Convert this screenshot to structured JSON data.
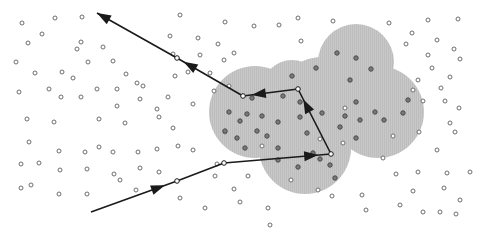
{
  "diagram": {
    "width": 482,
    "height": 228,
    "colors": {
      "background": "#ffffff",
      "cloud_fill": "#c8c8c8",
      "particle_outside": "#6e6e6e",
      "particle_inside_fill": "#7a7a7a",
      "particle_inside_stroke": "#4a4a4a",
      "path": "#1a1a1a"
    },
    "cloud": {
      "lobes": [
        {
          "cx": 356,
          "cy": 62,
          "r": 38
        },
        {
          "cx": 255,
          "cy": 112,
          "r": 46
        },
        {
          "cx": 305,
          "cy": 148,
          "r": 46
        },
        {
          "cx": 378,
          "cy": 112,
          "r": 46
        },
        {
          "cx": 322,
          "cy": 105,
          "r": 48
        },
        {
          "cx": 292,
          "cy": 90,
          "r": 30
        }
      ]
    },
    "path": {
      "vertices": [
        [
          91,
          212
        ],
        [
          177,
          181
        ],
        [
          224,
          163
        ],
        [
          331,
          154
        ],
        [
          298,
          89
        ],
        [
          243,
          96
        ],
        [
          177,
          58
        ],
        [
          97,
          13
        ]
      ],
      "arrowheads": [
        {
          "from": [
            91,
            212
          ],
          "to": [
            177,
            181
          ],
          "at": 0.86
        },
        {
          "from": [
            224,
            163
          ],
          "to": [
            331,
            154
          ],
          "at": 0.88
        },
        {
          "from": [
            331,
            154
          ],
          "to": [
            298,
            89
          ],
          "at": 0.84
        },
        {
          "from": [
            298,
            89
          ],
          "to": [
            243,
            96
          ],
          "at": 0.84
        },
        {
          "from": [
            243,
            96
          ],
          "to": [
            177,
            58
          ],
          "at": 0.9
        },
        {
          "from": [
            177,
            58
          ],
          "to": [
            97,
            13
          ],
          "at": 1.0
        }
      ]
    },
    "particles_outside": [
      [
        22,
        23
      ],
      [
        55,
        18
      ],
      [
        82,
        17
      ],
      [
        42,
        34
      ],
      [
        81,
        42
      ],
      [
        28,
        43
      ],
      [
        77,
        49
      ],
      [
        103,
        47
      ],
      [
        16,
        62
      ],
      [
        35,
        73
      ],
      [
        62,
        72
      ],
      [
        88,
        62
      ],
      [
        73,
        78
      ],
      [
        113,
        61
      ],
      [
        126,
        74
      ],
      [
        143,
        86
      ],
      [
        19,
        92
      ],
      [
        49,
        89
      ],
      [
        61,
        97
      ],
      [
        81,
        97
      ],
      [
        97,
        89
      ],
      [
        117,
        89
      ],
      [
        137,
        83
      ],
      [
        117,
        106
      ],
      [
        140,
        99
      ],
      [
        157,
        109
      ],
      [
        180,
        15
      ],
      [
        225,
        22
      ],
      [
        254,
        26
      ],
      [
        279,
        25
      ],
      [
        298,
        18
      ],
      [
        301,
        41
      ],
      [
        170,
        36
      ],
      [
        198,
        38
      ],
      [
        218,
        44
      ],
      [
        234,
        53
      ],
      [
        200,
        55
      ],
      [
        173,
        54
      ],
      [
        188,
        72
      ],
      [
        210,
        73
      ],
      [
        224,
        60
      ],
      [
        229,
        86
      ],
      [
        175,
        76
      ],
      [
        214,
        91
      ],
      [
        168,
        97
      ],
      [
        193,
        104
      ],
      [
        27,
        119
      ],
      [
        54,
        122
      ],
      [
        99,
        119
      ],
      [
        125,
        123
      ],
      [
        159,
        117
      ],
      [
        29,
        142
      ],
      [
        59,
        151
      ],
      [
        85,
        152
      ],
      [
        113,
        152
      ],
      [
        138,
        152
      ],
      [
        157,
        149
      ],
      [
        21,
        164
      ],
      [
        39,
        163
      ],
      [
        60,
        170
      ],
      [
        99,
        147
      ],
      [
        87,
        169
      ],
      [
        114,
        174
      ],
      [
        140,
        168
      ],
      [
        21,
        188
      ],
      [
        31,
        185
      ],
      [
        59,
        194
      ],
      [
        87,
        194
      ],
      [
        120,
        180
      ],
      [
        136,
        190
      ],
      [
        173,
        128
      ],
      [
        178,
        146
      ],
      [
        193,
        150
      ],
      [
        225,
        132
      ],
      [
        217,
        164
      ],
      [
        180,
        198
      ],
      [
        205,
        208
      ],
      [
        240,
        202
      ],
      [
        268,
        208
      ],
      [
        291,
        180
      ],
      [
        318,
        190
      ],
      [
        332,
        196
      ],
      [
        248,
        176
      ],
      [
        362,
        195
      ],
      [
        366,
        210
      ],
      [
        400,
        205
      ],
      [
        423,
        212
      ],
      [
        440,
        212
      ],
      [
        456,
        214
      ],
      [
        413,
        191
      ],
      [
        444,
        188
      ],
      [
        460,
        200
      ],
      [
        447,
        173
      ],
      [
        418,
        172
      ],
      [
        396,
        174
      ],
      [
        383,
        158
      ],
      [
        419,
        132
      ],
      [
        455,
        132
      ],
      [
        437,
        150
      ],
      [
        470,
        172
      ],
      [
        393,
        136
      ],
      [
        450,
        123
      ],
      [
        343,
        143
      ],
      [
        320,
        139
      ],
      [
        333,
        21
      ],
      [
        389,
        23
      ],
      [
        428,
        20
      ],
      [
        458,
        19
      ],
      [
        412,
        33
      ],
      [
        437,
        40
      ],
      [
        454,
        49
      ],
      [
        406,
        44
      ],
      [
        428,
        55
      ],
      [
        460,
        59
      ],
      [
        432,
        68
      ],
      [
        450,
        77
      ],
      [
        418,
        80
      ],
      [
        413,
        90
      ],
      [
        441,
        88
      ],
      [
        423,
        101
      ],
      [
        445,
        101
      ],
      [
        459,
        108
      ],
      [
        345,
        108
      ],
      [
        262,
        146
      ],
      [
        234,
        189
      ],
      [
        270,
        225
      ],
      [
        159,
        172
      ],
      [
        215,
        176
      ]
    ],
    "particles_inside": [
      [
        252,
        98
      ],
      [
        283,
        96
      ],
      [
        292,
        76
      ],
      [
        316,
        68
      ],
      [
        337,
        53
      ],
      [
        356,
        58
      ],
      [
        371,
        69
      ],
      [
        350,
        80
      ],
      [
        300,
        102
      ],
      [
        300,
        117
      ],
      [
        322,
        113
      ],
      [
        345,
        116
      ],
      [
        360,
        120
      ],
      [
        375,
        112
      ],
      [
        384,
        120
      ],
      [
        356,
        138
      ],
      [
        340,
        127
      ],
      [
        307,
        133
      ],
      [
        262,
        116
      ],
      [
        240,
        121
      ],
      [
        225,
        131
      ],
      [
        237,
        138
      ],
      [
        257,
        131
      ],
      [
        245,
        148
      ],
      [
        267,
        136
      ],
      [
        278,
        122
      ],
      [
        320,
        159
      ],
      [
        330,
        165
      ],
      [
        298,
        167
      ],
      [
        278,
        160
      ],
      [
        335,
        178
      ],
      [
        278,
        148
      ],
      [
        313,
        153
      ],
      [
        403,
        113
      ],
      [
        408,
        100
      ],
      [
        356,
        102
      ],
      [
        247,
        114
      ],
      [
        229,
        112
      ]
    ]
  }
}
